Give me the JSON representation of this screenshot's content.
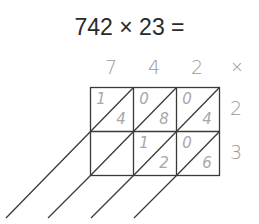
{
  "title": "742 × 23 =",
  "multiplicand_digits": [
    "7",
    "4",
    "2"
  ],
  "operator_symbol": "×",
  "multiplier_digits": [
    "2",
    "3"
  ],
  "grid": {
    "rows": [
      {
        "multiplier": "2",
        "cells": [
          {
            "tens": "1",
            "ones": "4"
          },
          {
            "tens": "0",
            "ones": "8"
          },
          {
            "tens": "0",
            "ones": "4"
          }
        ]
      },
      {
        "multiplier": "3",
        "cells": [
          {
            "tens": "",
            "ones": ""
          },
          {
            "tens": "1",
            "ones": "2"
          },
          {
            "tens": "0",
            "ones": "6"
          }
        ]
      }
    ]
  },
  "colors": {
    "grid_line": "#333333",
    "digit_gray": "#9a9a9a",
    "title_text": "#2a2a2a"
  }
}
